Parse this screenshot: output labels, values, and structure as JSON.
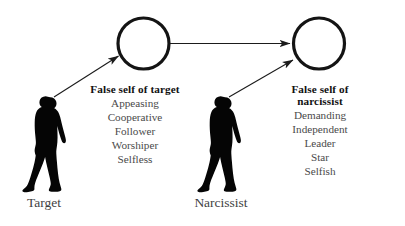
{
  "diagram": {
    "title_absent": "",
    "background_color": "#ffffff",
    "ink_color": "#111111",
    "nodes": {
      "target_circle": {
        "label": "empty-circle",
        "cx": 143,
        "cy": 43,
        "r": 26
      },
      "narcissist_circle": {
        "label": "empty-circle",
        "cx": 319,
        "cy": 43,
        "r": 26
      }
    },
    "actors": [
      {
        "id": "target",
        "label": "Target",
        "x": 44,
        "y": 196
      },
      {
        "id": "narcissist",
        "label": "Narcissist",
        "x": 221,
        "y": 196
      }
    ],
    "trait_blocks": [
      {
        "id": "false-self-of-target",
        "heading": "False self of target",
        "traits": [
          "Appeasing",
          "Cooperative",
          "Follower",
          "Worshiper",
          "Selfless"
        ]
      },
      {
        "id": "false-self-of-narcissist",
        "heading": "False self of narcissist",
        "traits": [
          "Demanding",
          "Independent",
          "Leader",
          "Star",
          "Selfish"
        ]
      }
    ],
    "arrows": [
      {
        "id": "target-to-false-self",
        "from": "target",
        "to": "target_circle",
        "style": "diagonal-up-right"
      },
      {
        "id": "narcissist-to-false-self",
        "from": "narcissist",
        "to": "narcissist_circle",
        "style": "diagonal-up-right"
      },
      {
        "id": "false-self-target-to-false-self-narcissist",
        "from": "target_circle",
        "to": "narcissist_circle",
        "style": "horizontal-right"
      }
    ]
  }
}
